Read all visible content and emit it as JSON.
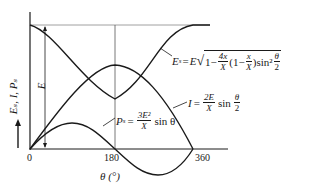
{
  "diagram": {
    "y_axis_label": "E_s, I, P_s",
    "y_axis_arrow": "up-arrow",
    "x_axis_label": "θ (°)",
    "x_ticks": [
      "0",
      "180",
      "360"
    ],
    "magnitude_label": "E",
    "curves": [
      {
        "name": "Es",
        "lhs": "E_s",
        "formula_text": "E_s = E √(1 − (4x/X)(1 − x/X) sin²(θ/2))",
        "shape": "starts at E at θ=0, minimum at θ=180, returns to E at θ=360"
      },
      {
        "name": "I",
        "lhs": "I",
        "formula_text": "I = (2E/X) sin(θ/2)",
        "shape": "starts at 0, maximum at θ=180, returns to 0 at θ=360"
      },
      {
        "name": "Ps",
        "lhs": "P_s",
        "formula_text": "P_s = (3E²/X) sin θ",
        "shape": "sine: positive 0–180, negative 180–360"
      }
    ]
  },
  "labels": {
    "es_lhs": "E",
    "es_sub": "s",
    "eq": "=",
    "es_E": "E",
    "one": "1−",
    "four_x": "4x",
    "X": "X",
    "paren_open": "(",
    "one2": "1−",
    "x": "x",
    "paren_close": ")",
    "sin2": "sin²",
    "theta": "θ",
    "two": "2",
    "i_lhs": "I",
    "two_E": "2E",
    "sin": "sin",
    "ps_lhs": "P",
    "ps_sub": "s",
    "three_E2": "3E²",
    "sin_theta": "sin θ",
    "y_axis": "Eₛ, I, Pₛ",
    "x_axis": "θ (°)",
    "E_mark": "E",
    "tick0": "0",
    "tick180": "180",
    "tick360": "360"
  }
}
